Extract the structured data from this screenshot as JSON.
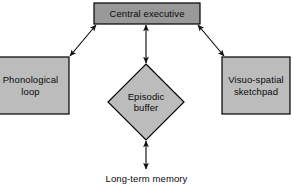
{
  "diagram": {
    "type": "block-diagram",
    "background_color": "#ffffff",
    "nodes": [
      {
        "id": "central-executive",
        "label": "Central executive",
        "shape": "rectangle",
        "fill_color": "#999999",
        "stroke_color": "#000000",
        "x": 94,
        "y": 3,
        "width": 106,
        "height": 21
      },
      {
        "id": "phonological-loop",
        "label": "Phonological\nloop",
        "shape": "rectangle",
        "fill_color": "#bcbcbc",
        "stroke_color": "#000000",
        "x": -8,
        "y": 57,
        "width": 77,
        "height": 57
      },
      {
        "id": "episodic-buffer",
        "label": "Episodic\nbuffer",
        "shape": "diamond",
        "fill_color": "#bcbcbc",
        "stroke_color": "#000000",
        "x": 108,
        "y": 64,
        "width": 76,
        "height": 76
      },
      {
        "id": "visuo-spatial-sketchpad",
        "label": "Visuo-spatial\nsketchpad",
        "shape": "rectangle",
        "fill_color": "#bcbcbc",
        "stroke_color": "#000000",
        "x": 222,
        "y": 57,
        "width": 68,
        "height": 57
      },
      {
        "id": "long-term-memory",
        "label": "Long-term memory",
        "shape": "text",
        "fill_color": "none",
        "stroke_color": "none",
        "x": 93,
        "y": 172,
        "width": 107,
        "height": 14
      }
    ],
    "connectors": [
      {
        "id": "ce-to-phonological-loop",
        "from": "central-executive",
        "to": "phonological-loop",
        "arrowheads": "both",
        "stroke_color": "#000000",
        "x1": 96,
        "y1": 25,
        "x2": 70,
        "y2": 56
      },
      {
        "id": "ce-to-episodic-buffer",
        "from": "central-executive",
        "to": "episodic-buffer",
        "arrowheads": "both",
        "stroke_color": "#000000",
        "x1": 146,
        "y1": 25,
        "x2": 146,
        "y2": 63
      },
      {
        "id": "ce-to-visuo-spatial-sketchpad",
        "from": "central-executive",
        "to": "visuo-spatial-sketchpad",
        "arrowheads": "both",
        "stroke_color": "#000000",
        "x1": 198,
        "y1": 25,
        "x2": 224,
        "y2": 56
      },
      {
        "id": "episodic-buffer-to-long-term-memory",
        "from": "episodic-buffer",
        "to": "long-term-memory",
        "arrowheads": "both",
        "stroke_color": "#000000",
        "x1": 146,
        "y1": 141,
        "x2": 146,
        "y2": 169
      }
    ]
  }
}
